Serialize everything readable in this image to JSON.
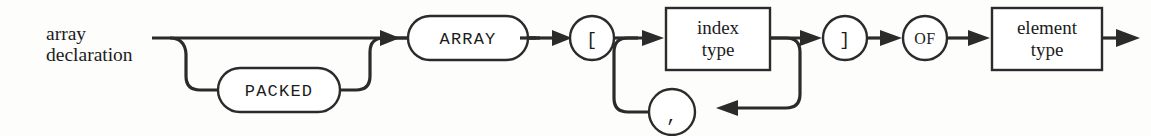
{
  "diagram": {
    "kind": "railroad-syntax-diagram",
    "title": "array declaration",
    "title_line_1": "array",
    "title_line_2": "declaration",
    "colors": {
      "background": "#fdfdfc",
      "line": "#2b2b2b",
      "node_fill": "#ffffff",
      "text": "#1c1c1c"
    },
    "nodes": [
      {
        "id": "packed",
        "shape": "stadium",
        "label": "PACKED",
        "font": "mono",
        "optional": true,
        "branch": "lower"
      },
      {
        "id": "array",
        "shape": "stadium",
        "label": "ARRAY",
        "font": "mono",
        "optional": false,
        "branch": "main"
      },
      {
        "id": "lbracket",
        "shape": "circle",
        "label": "[",
        "font": "mono",
        "optional": false,
        "branch": "main"
      },
      {
        "id": "index-type",
        "shape": "rect",
        "label_line_1": "index",
        "label_line_2": "type",
        "font": "serif",
        "optional": false,
        "branch": "main"
      },
      {
        "id": "comma-loop",
        "shape": "circle",
        "label": ",",
        "font": "mono",
        "optional": true,
        "branch": "loop"
      },
      {
        "id": "rbracket",
        "shape": "circle",
        "label": "]",
        "font": "mono",
        "optional": false,
        "branch": "main"
      },
      {
        "id": "of",
        "shape": "circle",
        "label": "OF",
        "font": "serif-caps",
        "optional": false,
        "branch": "main"
      },
      {
        "id": "element-type",
        "shape": "rect",
        "label_line_1": "element",
        "label_line_2": "type",
        "font": "serif",
        "optional": false,
        "branch": "main"
      }
    ]
  }
}
